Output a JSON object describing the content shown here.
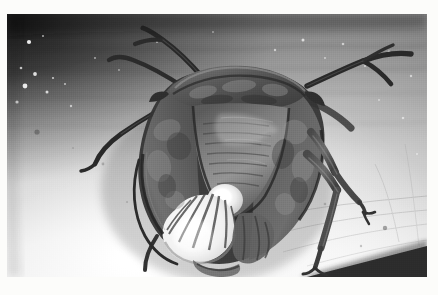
{
  "image": {
    "kind": "photograph",
    "medium": "black-and-white print with white border",
    "subject": "stink bug (shield bug, Pentatomidae) seen from above",
    "orientation": "landscape",
    "width_px": 438,
    "height_px": 295,
    "alt_text": "Black and white photograph of a shield bug resting on a pale textured surface, its antennae extended up and to the sides and its legs splayed out.",
    "border": {
      "color": "#fcfcfa",
      "left_px": 7,
      "top_px": 14,
      "right_px": 11,
      "bottom_px": 18
    },
    "photo_rect": {
      "x": 7,
      "y": 14,
      "w": 420,
      "h": 263
    }
  },
  "palette": {
    "border_white": "#fcfcfa",
    "background_dark": "#2e2e2c",
    "background_mid": "#8a8a86",
    "background_light": "#dedbd4",
    "background_highlight": "#f4f2ec",
    "body_dark": "#3d3c39",
    "body_mid": "#6a6762",
    "body_light": "#a3a099",
    "scutellum_white": "#efeee7",
    "membrane_white": "#f1efe8",
    "limb_dark": "#2b2a28",
    "corner_wedge": "#1b1b19"
  },
  "subject_parts": [
    {
      "name": "pronotum",
      "label": "Pronotum (shoulder shield)",
      "tone": "mid-dark mottled"
    },
    {
      "name": "scutellum",
      "label": "Scutellum (central triangle)",
      "tone": "dark with pale mottling"
    },
    {
      "name": "scutellum-tip",
      "label": "Scutellum tip",
      "tone": "bright white"
    },
    {
      "name": "left-hemelytron",
      "label": "Left forewing (hemelytron)",
      "tone": "dark grey"
    },
    {
      "name": "right-hemelytron",
      "label": "Right forewing (hemelytron)",
      "tone": "dark grey"
    },
    {
      "name": "membrane",
      "label": "Wing membrane",
      "tone": "bright white with dark veins"
    },
    {
      "name": "antenna-left",
      "label": "Left antenna",
      "tone": "near black"
    },
    {
      "name": "antenna-right",
      "label": "Right antenna",
      "tone": "near black"
    },
    {
      "name": "foreleg-left",
      "label": "Left foreleg",
      "tone": "near black"
    },
    {
      "name": "midleg-right",
      "label": "Right midleg",
      "tone": "dark grey"
    },
    {
      "name": "hindleg-right",
      "label": "Right hindleg",
      "tone": "dark grey"
    },
    {
      "name": "abdomen-tip",
      "label": "Abdomen tip",
      "tone": "mid grey"
    }
  ],
  "background": {
    "description": "Pale textured surface, strongly lit from lower-left; upper-left corner falls into deep shadow, lower-right corner carries a dark wedge.",
    "speckles_visible": true,
    "gradient_from": "#2e2e2c",
    "gradient_to": "#f4f2ec"
  },
  "text_content": {
    "visible_text": "",
    "note": "No text, captions, labels or UI chrome appear anywhere in the image."
  }
}
